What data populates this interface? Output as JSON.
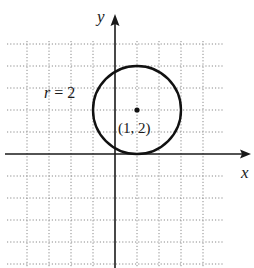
{
  "figure": {
    "width": 254,
    "height": 268,
    "origin_px": {
      "x": 115,
      "y": 154
    },
    "unit_px": 22,
    "grid": {
      "x_min": -5,
      "x_max": 5,
      "y_min": -5,
      "y_max": 5,
      "visible_left_px": 7,
      "visible_right_px": 223,
      "visible_top_px": 41,
      "visible_bottom_px": 268,
      "color": "#8a8a8a",
      "style": "dotted"
    },
    "axes": {
      "x_label": "x",
      "y_label": "y",
      "color": "#1a1a1a"
    },
    "circle": {
      "center": {
        "x": 1,
        "y": 2
      },
      "radius": 2,
      "color": "#111111"
    },
    "labels": {
      "radius_label": "r = 2",
      "center_label": "(1, 2)"
    }
  }
}
